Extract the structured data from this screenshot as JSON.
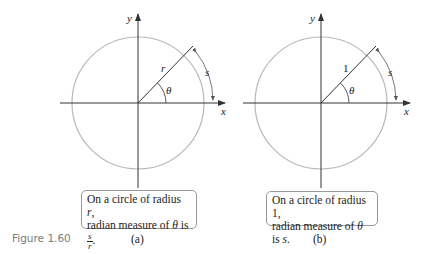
{
  "figure_number": "Figure 1.60",
  "panels": [
    {
      "id": "a",
      "label": "(a)",
      "axis_labels": {
        "x": "x",
        "y": "y"
      },
      "radius_label": "r",
      "angle_label": "θ",
      "arc_label": "s",
      "caption": {
        "line1_prefix": "On a circle of radius ",
        "line1_var": "r",
        "line1_suffix": ",",
        "line2_prefix": "radian measure of ",
        "line2_var": "θ",
        "line2_mid": " is ",
        "frac_num": "s",
        "frac_den": "r",
        "line2_suffix": "."
      }
    },
    {
      "id": "b",
      "label": "(b)",
      "axis_labels": {
        "x": "x",
        "y": "y"
      },
      "radius_label": "1",
      "angle_label": "θ",
      "arc_label": "s",
      "caption": {
        "line1": "On a circle of radius 1,",
        "line2_prefix": "radian measure of ",
        "line2_var": "θ",
        "line2_mid": " is ",
        "line2_var2": "s",
        "line2_suffix": "."
      }
    }
  ],
  "colors": {
    "circle": "#b8b8b8",
    "axis": "#333333",
    "text": "#222222",
    "figure_number": "#7a7a7a"
  }
}
